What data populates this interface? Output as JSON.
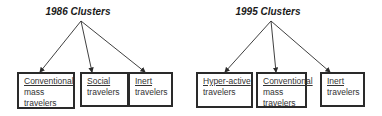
{
  "diagrams": [
    {
      "title": "1986 Clusters",
      "clusters": [
        {
          "name": "Conventional",
          "rest": [
            "mass",
            "travelers"
          ]
        },
        {
          "name": "Social",
          "rest": [
            "travelers"
          ]
        },
        {
          "name": "Inert",
          "rest": [
            "travelers"
          ]
        }
      ]
    },
    {
      "title": "1995 Clusters",
      "clusters": [
        {
          "name": "Hyper-active",
          "rest": [
            "travelers"
          ]
        },
        {
          "name": "Conventional",
          "rest": [
            "mass",
            "travelers"
          ]
        },
        {
          "name": "Inert",
          "rest": [
            "travelers"
          ]
        }
      ]
    }
  ],
  "colors": {
    "line": "#2a2a2a",
    "text": "#333333",
    "background": "#ffffff"
  }
}
